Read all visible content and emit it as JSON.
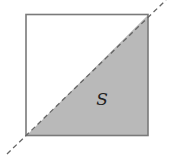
{
  "diagram": {
    "region_label": "S",
    "colors": {
      "fill": "#b8b8b8",
      "border": "#777777",
      "dashed_line": "#666666",
      "background": "#ffffff"
    }
  }
}
